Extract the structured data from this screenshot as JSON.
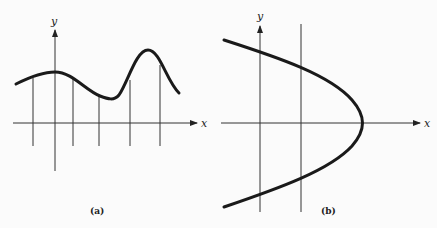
{
  "panels": [
    {
      "id": "a",
      "caption": "(a)",
      "x_axis_label": "x",
      "y_axis_label": "y",
      "description": "Smooth wavy curve above x-axis with vertical lines at sample points"
    },
    {
      "id": "b",
      "caption": "(b)",
      "x_axis_label": "x",
      "y_axis_label": "y",
      "description": "Sideways parabola opening left, crossed by y-axis and one vertical line"
    }
  ],
  "colors": {
    "ink": "#222222",
    "curve": "#1a1a1a",
    "background": "#fbfbfb"
  }
}
